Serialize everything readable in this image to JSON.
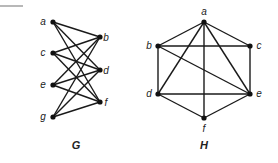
{
  "top_rule": {
    "x1": 0,
    "y1": 6,
    "x2": 23,
    "y2": 6,
    "color": "#888888"
  },
  "graphs": [
    {
      "name": "G",
      "title": {
        "text": "G",
        "x": 76,
        "y": 149
      },
      "nodes": [
        {
          "id": "a",
          "x": 53,
          "y": 22,
          "lx": 43,
          "ly": 25
        },
        {
          "id": "c",
          "x": 53,
          "y": 53,
          "lx": 43,
          "ly": 56
        },
        {
          "id": "e",
          "x": 53,
          "y": 85,
          "lx": 43,
          "ly": 88
        },
        {
          "id": "g",
          "x": 53,
          "y": 117,
          "lx": 43,
          "ly": 120
        },
        {
          "id": "b",
          "x": 100,
          "y": 37,
          "lx": 106,
          "ly": 41
        },
        {
          "id": "d",
          "x": 100,
          "y": 70,
          "lx": 106,
          "ly": 74
        },
        {
          "id": "f",
          "x": 100,
          "y": 102,
          "lx": 106,
          "ly": 106
        }
      ],
      "edges": [
        [
          "a",
          "b"
        ],
        [
          "a",
          "d"
        ],
        [
          "a",
          "f"
        ],
        [
          "c",
          "b"
        ],
        [
          "c",
          "d"
        ],
        [
          "c",
          "f"
        ],
        [
          "e",
          "b"
        ],
        [
          "e",
          "d"
        ],
        [
          "e",
          "f"
        ],
        [
          "g",
          "b"
        ],
        [
          "g",
          "d"
        ],
        [
          "g",
          "f"
        ]
      ]
    },
    {
      "name": "H",
      "title": {
        "text": "H",
        "x": 204,
        "y": 149
      },
      "nodes": [
        {
          "id": "a",
          "x": 204,
          "y": 22,
          "lx": 204,
          "ly": 15
        },
        {
          "id": "b",
          "x": 158,
          "y": 46,
          "lx": 149,
          "ly": 49
        },
        {
          "id": "c",
          "x": 250,
          "y": 46,
          "lx": 259,
          "ly": 49
        },
        {
          "id": "d",
          "x": 158,
          "y": 94,
          "lx": 149,
          "ly": 97
        },
        {
          "id": "e",
          "x": 250,
          "y": 94,
          "lx": 259,
          "ly": 97
        },
        {
          "id": "f",
          "x": 204,
          "y": 118,
          "lx": 204,
          "ly": 132
        }
      ],
      "edges": [
        [
          "a",
          "b"
        ],
        [
          "a",
          "c"
        ],
        [
          "a",
          "d"
        ],
        [
          "a",
          "e"
        ],
        [
          "a",
          "f"
        ],
        [
          "b",
          "c"
        ],
        [
          "b",
          "d"
        ],
        [
          "b",
          "e"
        ],
        [
          "c",
          "e"
        ],
        [
          "d",
          "e"
        ],
        [
          "d",
          "f"
        ],
        [
          "e",
          "f"
        ]
      ]
    }
  ]
}
